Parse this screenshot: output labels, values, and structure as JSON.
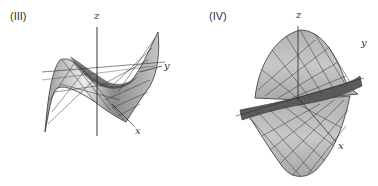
{
  "header": {
    "cut_off_text": ""
  },
  "panels": [
    {
      "label": "(III)",
      "axes": {
        "z": "z",
        "y": "y",
        "x": "x"
      },
      "description": "cubic saddle-like surface (monkey-saddle style) rendered as gray mesh"
    },
    {
      "label": "(IV)",
      "axes": {
        "z": "z",
        "y": "y",
        "x": "x"
      },
      "description": "twisted surface with large vertical lobe, rendered as gray mesh"
    }
  ],
  "colors": {
    "surface_light": "#e6e6e6",
    "surface_mid": "#b8b8b8",
    "surface_dark": "#555555",
    "mesh_line": "#333333",
    "axis": "#222222"
  }
}
